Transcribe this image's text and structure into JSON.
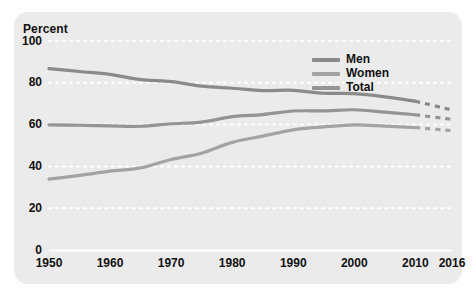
{
  "figure": {
    "panel_color": "#ebebeb",
    "background_color": "#ffffff"
  },
  "axis": {
    "ylabel": "Percent",
    "yticks": [
      "0",
      "20",
      "40",
      "60",
      "80",
      "100"
    ],
    "xticks": [
      "1950",
      "1960",
      "1970",
      "1980",
      "1990",
      "2000",
      "2010",
      "2016"
    ]
  },
  "legend": {
    "items": [
      {
        "label": "Men",
        "color": "#8a8a8a"
      },
      {
        "label": "Women",
        "color": "#a3a3a3"
      },
      {
        "label": "Total",
        "color": "#949494"
      }
    ]
  },
  "chart_data": {
    "type": "line",
    "title": "",
    "xlabel": "",
    "ylabel": "Percent",
    "xlim": [
      1950,
      2016
    ],
    "ylim": [
      0,
      100
    ],
    "yticks": [
      0,
      20,
      40,
      60,
      80,
      100
    ],
    "xticks": [
      1950,
      1960,
      1970,
      1980,
      1990,
      2000,
      2010,
      2016
    ],
    "grid": "horizontal-dotted-white",
    "legend_position": "upper-right-inside",
    "projection_note": "dashed segments from 2010 to 2016 indicate projected values",
    "x": [
      1950,
      1955,
      1960,
      1965,
      1970,
      1975,
      1980,
      1985,
      1990,
      1995,
      2000,
      2005,
      2010,
      2016
    ],
    "series": [
      {
        "name": "Men",
        "color": "#8a8a8a",
        "solid_until": 2010,
        "values": [
          86.8,
          85.4,
          84.0,
          81.5,
          80.6,
          78.4,
          77.4,
          76.3,
          76.4,
          75.0,
          74.8,
          73.3,
          71.2,
          67.0
        ]
      },
      {
        "name": "Total",
        "color": "#949494",
        "solid_until": 2010,
        "values": [
          59.9,
          59.7,
          59.4,
          59.2,
          60.4,
          61.2,
          63.8,
          64.8,
          66.5,
          66.6,
          67.1,
          66.0,
          64.7,
          62.5
        ]
      },
      {
        "name": "Women",
        "color": "#a3a3a3",
        "solid_until": 2010,
        "values": [
          33.9,
          35.7,
          37.7,
          39.3,
          43.3,
          46.3,
          51.5,
          54.5,
          57.5,
          58.9,
          59.9,
          59.3,
          58.6,
          57.1
        ]
      }
    ]
  }
}
